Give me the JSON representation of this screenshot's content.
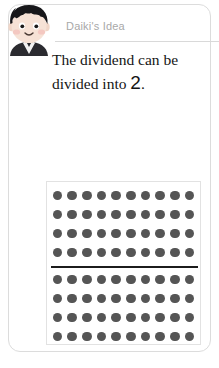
{
  "card": {
    "header": {
      "label": "Daiki's Idea",
      "avatar_icon": "boy-avatar-icon",
      "label_color": "#a8a8a8",
      "rule_color": "#d9d9d9"
    },
    "sentence": {
      "text_before": "The dividend can be divided into ",
      "number": "2",
      "text_after": ".",
      "full_text": "The dividend can be divided into 2.",
      "color": "#151515"
    },
    "dot_array": {
      "columns": 10,
      "rows": 8,
      "total_dots": 80,
      "dot_color": "#555555",
      "split_after_row": 4,
      "split_line_color": "#1c1c1c",
      "groups": [
        {
          "name": "top-group",
          "rows": 4,
          "dots_per_row": 10,
          "subtotal": 40
        },
        {
          "name": "bottom-group",
          "rows": 4,
          "dots_per_row": 10,
          "subtotal": 40
        }
      ],
      "box_border_color": "#e2e2e2"
    }
  }
}
